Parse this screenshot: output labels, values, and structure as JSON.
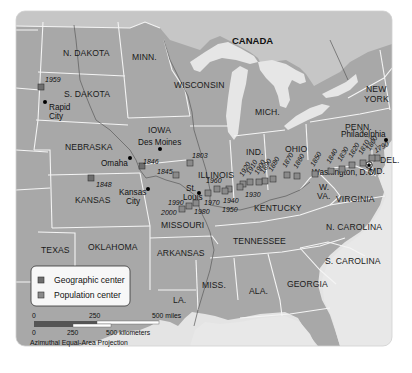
{
  "map": {
    "country_label": "CANADA",
    "colors": {
      "land": "#a9a9a9",
      "land_light": "#c4c4c4",
      "water": "#e6e6e6",
      "border": "#f2f2f2",
      "geographic_marker": "#6e6e6e",
      "population_marker": "#8a8a8a",
      "city_dot": "#000000"
    },
    "states": [
      {
        "id": "nd",
        "label": "N. DAKOTA"
      },
      {
        "id": "sd",
        "label": "S. DAKOTA"
      },
      {
        "id": "minn",
        "label": "MINN."
      },
      {
        "id": "wisc",
        "label": "WISCONSIN"
      },
      {
        "id": "mich",
        "label": "MICH."
      },
      {
        "id": "ny",
        "label": "NEW"
      },
      {
        "id": "ny2",
        "label": "YORK"
      },
      {
        "id": "iowa",
        "label": "IOWA"
      },
      {
        "id": "neb",
        "label": "NEBRASKA"
      },
      {
        "id": "ill",
        "label": "ILLINOIS"
      },
      {
        "id": "ind",
        "label": "IND."
      },
      {
        "id": "ohio",
        "label": "OHIO"
      },
      {
        "id": "penn",
        "label": "PENN."
      },
      {
        "id": "kansas",
        "label": "KANSAS"
      },
      {
        "id": "mo",
        "label": "MISSOURI"
      },
      {
        "id": "ky",
        "label": "KENTUCKY"
      },
      {
        "id": "wva1",
        "label": "W."
      },
      {
        "id": "wva2",
        "label": "VA."
      },
      {
        "id": "va",
        "label": "VIRGINIA"
      },
      {
        "id": "md",
        "label": "MD."
      },
      {
        "id": "del",
        "label": "DEL."
      },
      {
        "id": "texas",
        "label": "TEXAS"
      },
      {
        "id": "okla",
        "label": "OKLAHOMA"
      },
      {
        "id": "ark",
        "label": "ARKANSAS"
      },
      {
        "id": "tenn",
        "label": "TENNESSEE"
      },
      {
        "id": "nc",
        "label": "N. CAROLINA"
      },
      {
        "id": "sc",
        "label": "S. CAROLINA"
      },
      {
        "id": "la",
        "label": "LA."
      },
      {
        "id": "miss",
        "label": "MISS."
      },
      {
        "id": "ala",
        "label": "ALA."
      },
      {
        "id": "ga",
        "label": "GEORGIA"
      }
    ],
    "cities": [
      {
        "name": "Rapid",
        "name2": "City"
      },
      {
        "name": "Des Moines"
      },
      {
        "name": "Omaha"
      },
      {
        "name": "Kansas",
        "name2": "City"
      },
      {
        "name": "St.",
        "name2": "Louis"
      },
      {
        "name": "Philadelphia"
      },
      {
        "name": "Washington, D.C."
      }
    ],
    "geographic_centers": [
      {
        "year": "1959"
      },
      {
        "year": "1846"
      },
      {
        "year": "1848"
      }
    ],
    "population_centers": [
      {
        "year": "1790"
      },
      {
        "year": "1800"
      },
      {
        "year": "1810"
      },
      {
        "year": "1820"
      },
      {
        "year": "1830"
      },
      {
        "year": "1840"
      },
      {
        "year": "1850"
      },
      {
        "year": "1860"
      },
      {
        "year": "1870"
      },
      {
        "year": "1880"
      },
      {
        "year": "1890"
      },
      {
        "year": "1900"
      },
      {
        "year": "1910"
      },
      {
        "year": "1920"
      },
      {
        "year": "1930"
      },
      {
        "year": "1940"
      },
      {
        "year": "1950"
      },
      {
        "year": "1960"
      },
      {
        "year": "1970"
      },
      {
        "year": "1980"
      },
      {
        "year": "1990"
      },
      {
        "year": "2000"
      },
      {
        "year": "1845"
      },
      {
        "year": "1803"
      }
    ]
  },
  "legend": {
    "items": [
      {
        "label": "Geographic center",
        "color": "#6e6e6e"
      },
      {
        "label": "Population center",
        "color": "#8a8a8a"
      }
    ]
  },
  "scale": {
    "miles_labels": [
      "0",
      "250",
      "500 miles"
    ],
    "km_labels": [
      "0",
      "250",
      "500 kilometers"
    ],
    "projection": "Azimuthal Equal-Area Projection"
  }
}
